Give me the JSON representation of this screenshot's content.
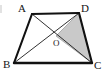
{
  "figure": {
    "kind": "geometry-diagram",
    "background_color": "#ffffff",
    "stroke_color": "#111111",
    "diagonal_color": "#1a1a1a",
    "shade_color": "#c9c9c9",
    "shade_stroke_color": "#8a8a8a",
    "edge_stroke_width": 2.1,
    "diagonal_stroke_width": 0.9,
    "vertices": [
      {
        "id": "A",
        "label": "A",
        "x": 32,
        "y": 14,
        "label_x": 18,
        "label_y": 3
      },
      {
        "id": "D",
        "label": "D",
        "x": 79,
        "y": 13,
        "label_x": 81,
        "label_y": 3
      },
      {
        "id": "B",
        "label": "B",
        "x": 14,
        "y": 63,
        "label_x": 3,
        "label_y": 59
      },
      {
        "id": "C",
        "label": "C",
        "x": 92,
        "y": 63,
        "label_x": 94,
        "label_y": 60
      }
    ],
    "interior_points": [
      {
        "id": "O",
        "label": "O",
        "x": 56,
        "y": 36,
        "label_x": 53,
        "label_y": 39
      }
    ],
    "edges": [
      {
        "id": "AD",
        "from": "A",
        "to": "D",
        "style": "thick"
      },
      {
        "id": "AB",
        "from": "A",
        "to": "B",
        "style": "thick"
      },
      {
        "id": "BC",
        "from": "B",
        "to": "C",
        "style": "thick"
      },
      {
        "id": "DC",
        "from": "D",
        "to": "C",
        "style": "thick"
      }
    ],
    "diagonals": [
      {
        "id": "AC",
        "from": "A",
        "to": "C",
        "style": "thin"
      },
      {
        "id": "BD",
        "from": "B",
        "to": "D",
        "style": "thin"
      }
    ],
    "shaded_regions": [
      {
        "id": "ODC",
        "vertices": "O,D,C",
        "points": "56,36 79,13 92,63"
      }
    ],
    "artifacts": [
      {
        "id": "left-edge-mark",
        "note": "faint cropped mark at left border"
      }
    ]
  }
}
